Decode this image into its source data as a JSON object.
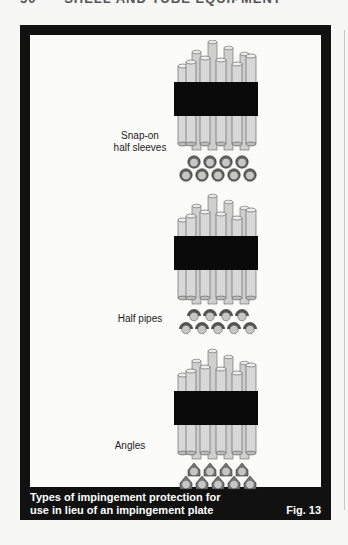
{
  "running_head": {
    "page_number": "50",
    "title": "SHELL AND TUBE EQUIPMENT"
  },
  "figure": {
    "panels": [
      {
        "label_line1": "Snap-on",
        "label_line2": "half sleeves",
        "end_shape": "sleeve"
      },
      {
        "label_line1": "Half pipes",
        "label_line2": "",
        "end_shape": "halfpipe"
      },
      {
        "label_line1": "Angles",
        "label_line2": "",
        "end_shape": "angle"
      }
    ],
    "caption_line1": "Types of impingement protection for",
    "caption_line2": "use in lieu of an impingement plate",
    "fig_number": "Fig. 13"
  }
}
